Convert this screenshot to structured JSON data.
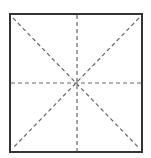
{
  "diagram": {
    "type": "square-grid-with-diagonals",
    "square": {
      "x": 10,
      "y": 14,
      "width": 132,
      "height": 138,
      "stroke": "#333333",
      "stroke_width": 2
    },
    "guide_lines": {
      "stroke": "#666666",
      "stroke_width": 1.2,
      "dash": "4,3",
      "lines": [
        {
          "name": "vertical-center-line",
          "x1": 77,
          "y1": 15,
          "x2": 77,
          "y2": 151
        },
        {
          "name": "horizontal-center-line",
          "x1": 11,
          "y1": 83,
          "x2": 141,
          "y2": 83
        },
        {
          "name": "diagonal-tl-br-line",
          "x1": 13,
          "y1": 18,
          "x2": 139,
          "y2": 148
        },
        {
          "name": "diagonal-tr-bl-line",
          "x1": 139,
          "y1": 18,
          "x2": 13,
          "y2": 148
        }
      ]
    }
  }
}
